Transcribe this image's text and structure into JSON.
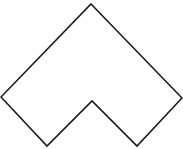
{
  "diagram": {
    "background": "#ffffff",
    "shape": {
      "type": "chevron-outline",
      "stroke": "#1a1a1a",
      "fill": "#ffffff",
      "stroke_width": 1.6,
      "points": "91,4 182,98 137,146 92,101 47,146 1,97"
    }
  }
}
